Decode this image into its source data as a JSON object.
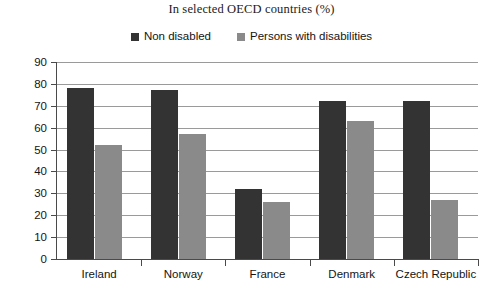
{
  "chart_data": {
    "type": "bar",
    "title": "In selected OECD countries (%)",
    "xlabel": "",
    "ylabel": "",
    "ylim": [
      0,
      90
    ],
    "ytick_step": 10,
    "yticks": [
      "90",
      "80",
      "70",
      "60",
      "50",
      "40",
      "30",
      "20",
      "10",
      "0"
    ],
    "grid": true,
    "grid_axis": "y",
    "legend_position": "top-center",
    "categories": [
      "Ireland",
      "Norway",
      "France",
      "Denmark",
      "Czech Republic"
    ],
    "series": [
      {
        "name": "Non disabled",
        "color": "#333333",
        "values": [
          78,
          77,
          32,
          72,
          72
        ]
      },
      {
        "name": "Persons with disabilities",
        "color": "#8a8a8a",
        "values": [
          52,
          57,
          26,
          63,
          27
        ]
      }
    ]
  },
  "colors": {
    "series_non_disabled": "#333333",
    "series_with_disabilities": "#8a8a8a",
    "gridline": "#9a9a9a",
    "axis": "#4a4a4a",
    "background": "#ffffff",
    "text": "#141414"
  }
}
